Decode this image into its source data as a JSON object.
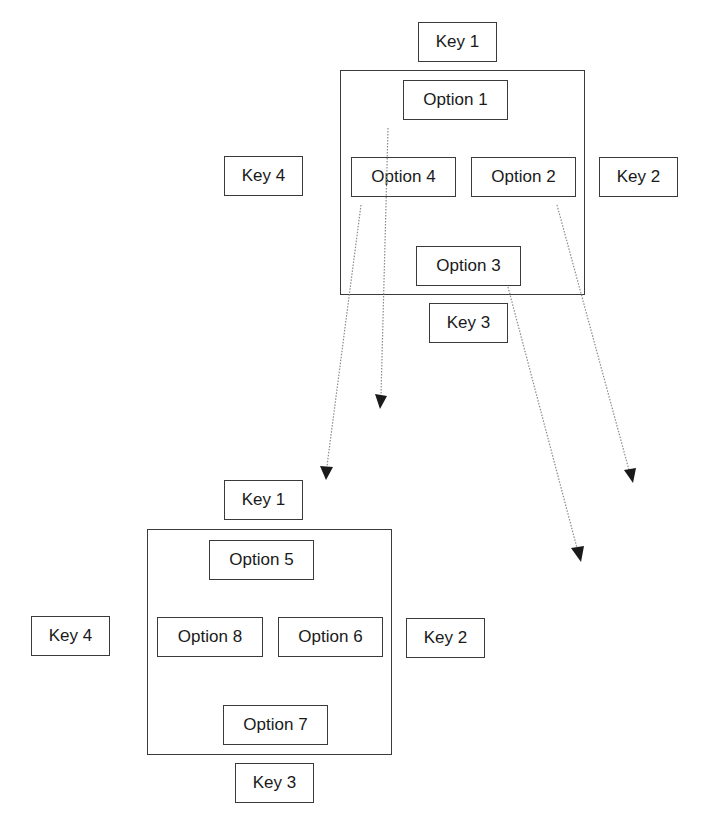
{
  "diagram": {
    "top_group": {
      "keys": {
        "key1": "Key 1",
        "key2": "Key 2",
        "key3": "Key 3",
        "key4": "Key 4"
      },
      "options": {
        "option1": "Option 1",
        "option2": "Option 2",
        "option3": "Option 3",
        "option4": "Option 4"
      }
    },
    "bottom_group": {
      "keys": {
        "key1": "Key 1",
        "key2": "Key 2",
        "key3": "Key 3",
        "key4": "Key 4"
      },
      "options": {
        "option5": "Option 5",
        "option6": "Option 6",
        "option7": "Option 7",
        "option8": "Option 8"
      }
    },
    "arrows": [
      {
        "from": "Option 1",
        "style": "dotted"
      },
      {
        "from": "Option 4",
        "style": "dotted"
      },
      {
        "from": "Option 2",
        "style": "dotted"
      },
      {
        "from": "Option 3",
        "style": "dotted"
      }
    ],
    "colors": {
      "line": "#3a3a3a",
      "arrow_head": "#1a1a1a",
      "dotted": "#888888"
    }
  }
}
